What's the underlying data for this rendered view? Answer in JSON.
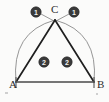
{
  "figure": {
    "background_color": "#fbfbfa",
    "line_color": "#1f1f1f",
    "arc_color": "#8a8a8a",
    "badge_fill": "#3a3a3a",
    "badge_text_color": "#f2f2f0"
  },
  "vertices": [
    {
      "id": "A",
      "label": "A",
      "x": 16,
      "y": 82
    },
    {
      "id": "B",
      "label": "B",
      "x": 94,
      "y": 82
    },
    {
      "id": "C",
      "label": "C",
      "x": 55,
      "y": 20
    }
  ],
  "vertex_labels": [
    {
      "name": "vertex-label-a",
      "text": "A",
      "x": 9,
      "y": 88
    },
    {
      "name": "vertex-label-b",
      "text": "B",
      "x": 97,
      "y": 88
    },
    {
      "name": "vertex-label-c",
      "text": "C",
      "x": 51,
      "y": 13
    }
  ],
  "angle_badges": [
    {
      "name": "angle-badge-c-left",
      "text": "1",
      "x": 36,
      "y": 12,
      "r": 5.2
    },
    {
      "name": "angle-badge-c-right",
      "text": "1",
      "x": 74,
      "y": 12,
      "r": 5.2
    },
    {
      "name": "angle-badge-a",
      "text": "2",
      "x": 44,
      "y": 62,
      "r": 5.2
    },
    {
      "name": "angle-badge-b",
      "text": "2",
      "x": 67,
      "y": 62,
      "r": 5.2
    }
  ],
  "segments": [
    {
      "name": "side-ac",
      "path": "M 16 82 L 55 20"
    },
    {
      "name": "side-bc",
      "path": "M 94 82 L 55 20"
    },
    {
      "name": "base-ab",
      "path": "M 16 82 L 94 82"
    }
  ],
  "arcs": [
    {
      "name": "arc-a-to-c",
      "path": "M 16 82 Q 11 32 55 20"
    },
    {
      "name": "arc-c-to-b",
      "path": "M 55 20 Q 99 32 94 82"
    }
  ],
  "leaders": [
    {
      "name": "leader-badge-c-left",
      "path": "M 41 14 L 54 21"
    },
    {
      "name": "leader-badge-c-right",
      "path": "M 69 14 L 56 21"
    }
  ],
  "ticks": [
    {
      "name": "tick-at-a",
      "path": "M 16 77 L 16 88"
    },
    {
      "name": "tick-at-b",
      "path": "M 94 77 L 94 88"
    }
  ]
}
